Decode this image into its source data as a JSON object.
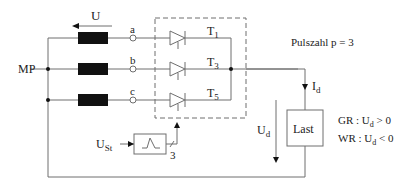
{
  "diagram": {
    "type": "circuit-schematic",
    "labels": {
      "voltage_source": "U",
      "midpoint": "MP",
      "phase_a": "a",
      "phase_b": "b",
      "phase_c": "c",
      "thyristor_1": "T",
      "thyristor_1_sub": "1",
      "thyristor_3": "T",
      "thyristor_3_sub": "3",
      "thyristor_5": "T",
      "thyristor_5_sub": "5",
      "pulse_count": "Pulszahl p = 3",
      "current": "I",
      "current_sub": "d",
      "dc_voltage": "U",
      "dc_voltage_sub": "d",
      "load": "Last",
      "control_voltage": "U",
      "control_voltage_sub": "St",
      "control_channels": "3",
      "rectifier_mode": "GR : U",
      "rectifier_mode_sub": "d",
      "rectifier_mode_cond": " > 0",
      "inverter_mode": "WR : U",
      "inverter_mode_sub": "d",
      "inverter_mode_cond": " < 0"
    },
    "colors": {
      "line": "#6e6e6e",
      "inductor": "#111111",
      "text": "#222222"
    }
  }
}
